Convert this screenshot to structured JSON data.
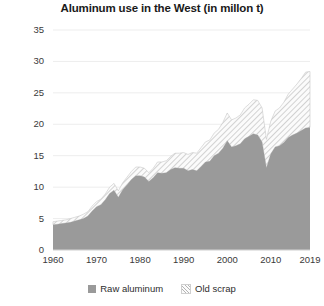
{
  "chart_data": {
    "type": "area",
    "title": "Aluminum use in the West (in millon t)",
    "xlabel": "",
    "ylabel": "",
    "stacked": true,
    "grid": true,
    "grid_axis": "y",
    "legend_position": "bottom",
    "xlim": [
      1960,
      2019
    ],
    "ylim": [
      0,
      35
    ],
    "yticks": [
      0,
      5,
      10,
      15,
      20,
      25,
      30,
      35
    ],
    "ytick_labels": [
      "0",
      "5",
      "10",
      "15",
      "20",
      "25",
      "30",
      "35"
    ],
    "xticks": [
      1960,
      1970,
      1980,
      1990,
      2000,
      2010,
      2019
    ],
    "xtick_labels": [
      "1960",
      "1970",
      "1980",
      "1990",
      "2000",
      "2010",
      "2019"
    ],
    "colors": {
      "raw_aluminum": "#9a9a9a",
      "old_scrap": "#fbfbfb",
      "old_scrap_hatch": "#b4b4b4",
      "gridline": "#ededed",
      "axis_text": "#3a3a3a",
      "title_text": "#1a1a1a"
    },
    "x": [
      1960,
      1961,
      1962,
      1963,
      1964,
      1965,
      1966,
      1967,
      1968,
      1969,
      1970,
      1971,
      1972,
      1973,
      1974,
      1975,
      1976,
      1977,
      1978,
      1979,
      1980,
      1981,
      1982,
      1983,
      1984,
      1985,
      1986,
      1987,
      1988,
      1989,
      1990,
      1991,
      1992,
      1993,
      1994,
      1995,
      1996,
      1997,
      1998,
      1999,
      2000,
      2001,
      2002,
      2003,
      2004,
      2005,
      2006,
      2007,
      2008,
      2009,
      2010,
      2011,
      2012,
      2013,
      2014,
      2015,
      2016,
      2017,
      2018,
      2019
    ],
    "series": [
      {
        "name": "Raw aluminum",
        "fill": "solid",
        "values": [
          4.0,
          4.1,
          4.2,
          4.3,
          4.4,
          4.6,
          4.8,
          5.0,
          5.4,
          6.2,
          6.9,
          7.2,
          8.0,
          9.0,
          9.5,
          8.4,
          9.6,
          10.4,
          11.2,
          11.8,
          11.8,
          11.6,
          10.9,
          11.5,
          12.3,
          12.2,
          12.3,
          12.8,
          13.1,
          13.0,
          13.0,
          12.6,
          12.8,
          12.6,
          13.3,
          14.0,
          14.1,
          15.0,
          15.4,
          16.2,
          17.4,
          16.4,
          16.6,
          16.9,
          17.7,
          18.1,
          18.5,
          18.3,
          17.2,
          13.1,
          15.3,
          16.4,
          16.6,
          17.1,
          17.9,
          18.3,
          18.6,
          19.0,
          19.4,
          19.5
        ]
      },
      {
        "name": "Old scrap",
        "fill": "hatched",
        "values": [
          0.5,
          0.5,
          0.5,
          0.5,
          0.6,
          0.6,
          0.6,
          0.7,
          0.7,
          0.8,
          0.8,
          0.9,
          0.9,
          1.0,
          1.1,
          1.0,
          1.1,
          1.2,
          1.3,
          1.4,
          1.4,
          1.4,
          1.4,
          1.5,
          1.7,
          1.8,
          1.9,
          2.1,
          2.3,
          2.4,
          2.5,
          2.6,
          2.7,
          2.8,
          3.0,
          3.2,
          3.4,
          3.6,
          3.8,
          4.1,
          4.4,
          4.3,
          4.4,
          4.6,
          4.9,
          5.1,
          5.4,
          5.5,
          5.4,
          4.5,
          5.2,
          5.7,
          6.0,
          6.4,
          6.9,
          7.3,
          7.8,
          8.3,
          8.9,
          8.9
        ]
      }
    ],
    "totals": [
      4.5,
      4.6,
      4.7,
      4.8,
      5.0,
      5.2,
      5.4,
      5.7,
      6.1,
      7.0,
      7.7,
      8.1,
      8.9,
      10.0,
      10.6,
      9.4,
      10.7,
      11.6,
      12.5,
      13.2,
      13.2,
      13.0,
      12.3,
      13.0,
      14.0,
      14.0,
      14.2,
      14.9,
      15.4,
      15.4,
      15.5,
      15.2,
      15.5,
      15.4,
      16.3,
      17.2,
      17.5,
      18.6,
      19.2,
      20.3,
      21.8,
      20.7,
      21.0,
      21.5,
      22.6,
      23.2,
      23.9,
      23.8,
      22.6,
      17.6,
      20.5,
      22.1,
      22.6,
      23.5,
      24.8,
      25.6,
      26.4,
      27.3,
      28.3,
      28.4
    ],
    "legend": [
      {
        "label": "Raw aluminum",
        "swatch": "solid"
      },
      {
        "label": "Old scrap",
        "swatch": "hatch"
      }
    ]
  }
}
